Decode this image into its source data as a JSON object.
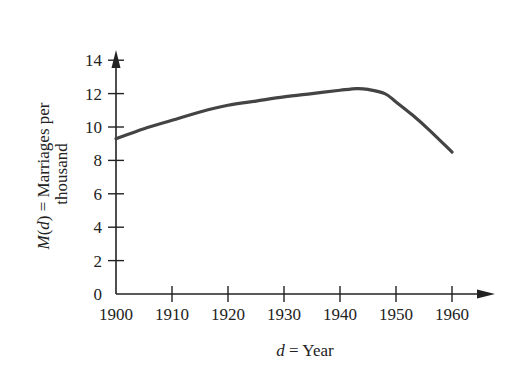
{
  "chart_data": {
    "type": "line",
    "title": "",
    "xlabel_var": "d",
    "xlabel_rest": " = Year",
    "ylabel_line1_var": "M",
    "ylabel_line1_paren_open": "(",
    "ylabel_line1_arg": "d",
    "ylabel_line1_rest": ") = Marriages per",
    "ylabel_line2": "thousand",
    "xlim": [
      1900,
      1967
    ],
    "ylim": [
      0,
      15
    ],
    "x_ticks": [
      1900,
      1910,
      1920,
      1930,
      1940,
      1950,
      1960
    ],
    "y_ticks": [
      0,
      2,
      4,
      6,
      8,
      10,
      12,
      14
    ],
    "grid": false,
    "legend": null,
    "series": [
      {
        "name": "M(d)",
        "color": "#444444",
        "x": [
          1900,
          1905,
          1910,
          1915,
          1920,
          1925,
          1930,
          1935,
          1940,
          1943,
          1945,
          1948,
          1950,
          1953,
          1956,
          1960
        ],
        "y": [
          9.3,
          9.9,
          10.4,
          10.9,
          11.3,
          11.55,
          11.8,
          12.0,
          12.2,
          12.3,
          12.25,
          12.0,
          11.5,
          10.7,
          9.8,
          8.5
        ]
      }
    ]
  }
}
